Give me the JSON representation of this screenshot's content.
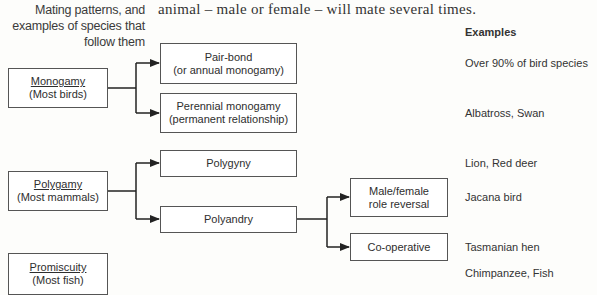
{
  "caption": {
    "lines": [
      "Mating patterns, and",
      "examples of species that",
      "follow them"
    ]
  },
  "body_text": "animal – male or female – will mate several times.",
  "examples_header": "Examples",
  "categories": [
    {
      "title": "Monogamy",
      "subtitle": "(Most birds)"
    },
    {
      "title": "Polygamy",
      "subtitle": "(Most mammals)"
    },
    {
      "title": "Promiscuity",
      "subtitle": "(Most fish)"
    }
  ],
  "subtypes": {
    "pair_bond": {
      "line1": "Pair-bond",
      "line2": "(or annual monogamy)"
    },
    "perennial": {
      "line1": "Perennial monogamy",
      "line2": "(permanent relationship)"
    },
    "polygyny": {
      "line1": "Polygyny"
    },
    "polyandry": {
      "line1": "Polyandry"
    },
    "role_reversal": {
      "line1": "Male/female",
      "line2": "role reversal"
    },
    "cooperative": {
      "line1": "Co-operative"
    }
  },
  "examples": [
    {
      "pattern": "Pair-bond",
      "text": "Over 90% of bird species"
    },
    {
      "pattern": "Perennial monogamy",
      "text": "Albatross, Swan"
    },
    {
      "pattern": "Polygyny",
      "text": "Lion, Red deer"
    },
    {
      "pattern": "Male/female role reversal",
      "text": "Jacana bird"
    },
    {
      "pattern": "Co-operative",
      "text": "Tasmanian hen"
    },
    {
      "pattern": "Promiscuity",
      "text": "Chimpanzee, Fish"
    }
  ]
}
